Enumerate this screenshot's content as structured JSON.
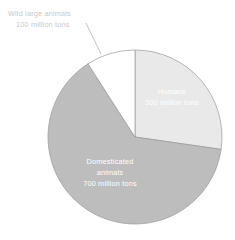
{
  "chart_data": {
    "type": "pie",
    "title": "",
    "subtitle": "",
    "xlabel": "",
    "ylabel": "",
    "grid": false,
    "legend": "none",
    "unit": "million tons",
    "total": 1100,
    "start_angle_deg": 0,
    "direction": "clockwise",
    "categories": [
      "Humans",
      "Domesticated animals",
      "Wild large animals"
    ],
    "values": [
      300,
      700,
      100
    ],
    "slices": [
      {
        "name": "Humans",
        "value": 300,
        "value_text": "300 million tons",
        "label_lines": [
          "Humans",
          "300 million tons"
        ],
        "label_placement": "inside",
        "fill": "#e9e9e9",
        "stroke": "#9a9a9a",
        "text_color": "#ffffff",
        "angle_deg": 98.2,
        "percent": 27.3
      },
      {
        "name": "Domesticated animals",
        "value": 700,
        "value_text": "700 million tons",
        "label_lines": [
          "Domesticated",
          "animals",
          "700 million tons"
        ],
        "label_placement": "inside",
        "fill": "#bdbdbd",
        "stroke": "#9a9a9a",
        "text_color": "#ffffff",
        "angle_deg": 229.1,
        "percent": 63.6
      },
      {
        "name": "Wild large animals",
        "value": 100,
        "value_text": "100 million tons",
        "label_lines": [
          "Wild large animals",
          "100 million tons"
        ],
        "label_placement": "outside-callout",
        "fill": "#ffffff",
        "stroke": "#9a9a9a",
        "text_color": "#c9c9c9",
        "angle_deg": 32.7,
        "percent": 9.1
      }
    ]
  },
  "colors": {
    "background": "#ffffff",
    "humans_slice": "#e9e9e9",
    "domesticated_slice": "#bdbdbd",
    "wild_slice": "#ffffff",
    "slice_outline": "#9a9a9a",
    "inside_label_text": "#ffffff",
    "outside_label_text": "#c9c9c9",
    "leader_line": "#a8a8a8"
  },
  "labels": {
    "humans_line_1": "Humans",
    "humans_line_2": "300 million tons",
    "domesticated_line_1": "Domesticated",
    "domesticated_line_2": "animals",
    "domesticated_line_3": "700 million tons",
    "wild_line_1": "Wild large animals",
    "wild_line_2": "100 million tons"
  }
}
